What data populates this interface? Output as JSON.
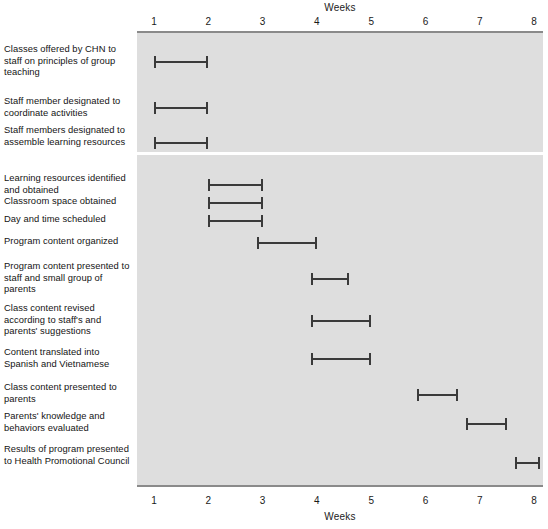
{
  "chart_data": {
    "type": "bar",
    "chart_kind": "gantt",
    "title": "",
    "xlabel": "Weeks",
    "ylabel": "",
    "xlim": [
      0.5,
      8.6
    ],
    "xticks": [
      1,
      2,
      3,
      4,
      5,
      6,
      7,
      8
    ],
    "xtick_labels": [
      "1",
      "2",
      "3",
      "4",
      "5",
      "6",
      "7",
      "8"
    ],
    "axis_title_top": "Weeks",
    "axis_title_bottom": "Weeks",
    "grid": false,
    "legend": null,
    "panel_background": "#dedede",
    "bar_color": "#3a3a3a",
    "groups": [
      {
        "name": "upper",
        "tasks": [
          {
            "label": "Classes offered by CHN to staff on principles of group teaching",
            "start": 1.0,
            "end": 2.0
          },
          {
            "label": "Staff member designated to coordinate activities",
            "start": 1.0,
            "end": 2.0
          },
          {
            "label": "Staff members designated to assemble learning resources",
            "start": 1.0,
            "end": 2.0
          }
        ]
      },
      {
        "name": "lower",
        "tasks": [
          {
            "label": "Learning resources identified and obtained",
            "start": 2.0,
            "end": 3.0
          },
          {
            "label": "Classroom space obtained",
            "start": 2.0,
            "end": 3.0
          },
          {
            "label": "Day and time scheduled",
            "start": 2.0,
            "end": 3.0
          },
          {
            "label": "Program content organized",
            "start": 2.9,
            "end": 4.0
          },
          {
            "label": "Program content presented to staff and small group of parents",
            "start": 3.9,
            "end": 4.6
          },
          {
            "label": "Class content revised according to staff's and parents' suggestions",
            "start": 3.9,
            "end": 5.0
          },
          {
            "label": "Content translated into Spanish and Vietnamese",
            "start": 3.9,
            "end": 5.0
          },
          {
            "label": "Class content presented to parents",
            "start": 5.85,
            "end": 6.6
          },
          {
            "label": "Parents' knowledge and behaviors evaluated",
            "start": 6.75,
            "end": 7.5
          },
          {
            "label": "Results of program presented to Health Promotional Council",
            "start": 7.65,
            "end": 8.1
          }
        ]
      }
    ]
  }
}
